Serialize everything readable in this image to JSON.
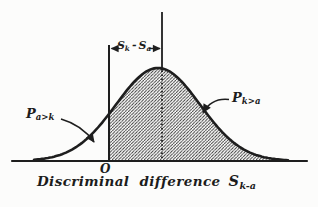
{
  "figure": {
    "ink_color": "#1e1e1e",
    "paper_color": "#fcfcfb",
    "axis_title": {
      "text": "Discriminal difference",
      "symbol_main": "S",
      "symbol_sub": "k-a"
    },
    "origin_label": "O",
    "gap_label": {
      "s1_main": "S",
      "s1_sub": "k",
      "minus": "-",
      "s2_main": "S",
      "s2_sub": "a"
    },
    "left_probability_label": {
      "main": "P",
      "sub": "a>k"
    },
    "right_probability_label": {
      "main": "P",
      "sub": "k>a"
    },
    "distribution": {
      "shape": "normal",
      "hatched_region": "area under curve right of origin O",
      "markers": "vertical line at origin O and dotted vertical line at distribution mean, separated by S_k - S_a"
    }
  }
}
